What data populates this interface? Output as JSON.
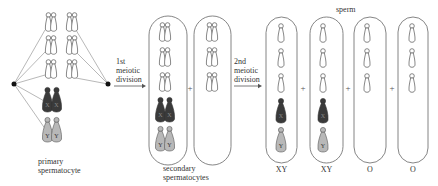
{
  "diagram": {
    "stages": {
      "primary": {
        "label_line1": "primary",
        "label_line2": "spermatocyte"
      },
      "first_division": {
        "line1": "1st",
        "line2": "meiotic",
        "line3": "division"
      },
      "secondary": {
        "label_line1": "secondary",
        "label_line2": "spermatocytes"
      },
      "second_division": {
        "line1": "2nd",
        "line2": "meiotic",
        "line3": "division"
      },
      "sperm": {
        "label": "sperm"
      }
    },
    "plus_sign": "+",
    "sperm_genotypes": [
      "XY",
      "XY",
      "O",
      "O"
    ],
    "chromosome_labels": {
      "x": "X",
      "y": "Y"
    },
    "colors": {
      "outline": "#555555",
      "x_fill": "#3a3a3a",
      "y_fill": "#b8b8b8",
      "autosome_fill": "#ffffff"
    }
  }
}
